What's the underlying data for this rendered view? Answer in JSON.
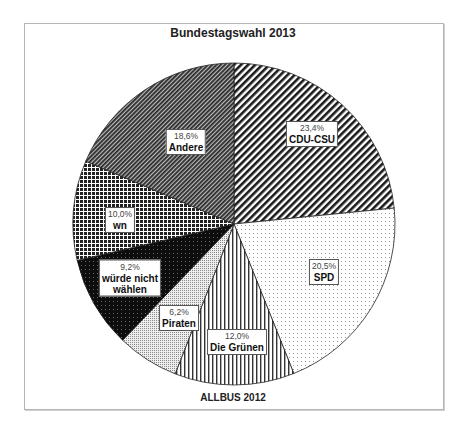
{
  "chart_data": {
    "type": "pie",
    "title": "Bundestagswahl 2013",
    "source_note": "ALLBUS 2012",
    "start_angle_deg": 0,
    "direction": "clockwise",
    "slices": [
      {
        "label": "CDU-CSU",
        "value": 23.4,
        "pct_text": "23,4%",
        "pattern": "diag-wide"
      },
      {
        "label": "SPD",
        "value": 20.5,
        "pct_text": "20,5%",
        "pattern": "dots-light"
      },
      {
        "label": "Die Grünen",
        "value": 12.0,
        "pct_text": "12,0%",
        "pattern": "vertical-lines"
      },
      {
        "label": "Piraten",
        "value": 6.2,
        "pct_text": "6,2%",
        "pattern": "dots-dense"
      },
      {
        "label": "würde nicht wählen",
        "value": 9.2,
        "pct_text": "9,2%",
        "pattern": "black-dots"
      },
      {
        "label": "wn",
        "value": 10.0,
        "pct_text": "10,0%",
        "pattern": "grid"
      },
      {
        "label": "Andere",
        "value": 18.6,
        "pct_text": "18,6%",
        "pattern": "diag-fine"
      }
    ],
    "labels": {
      "cdu": {
        "pct": "23,4%",
        "name": "CDU-CSU"
      },
      "spd": {
        "pct": "20,5%",
        "name": "SPD"
      },
      "gruene": {
        "pct": "12,0%",
        "name": "Die Grünen"
      },
      "piraten": {
        "pct": "6,2%",
        "name": "Piraten"
      },
      "nicht": {
        "pct": "9,2%",
        "name1": "würde nicht",
        "name2": "wählen"
      },
      "wn": {
        "pct": "10,0%",
        "name": "wn"
      },
      "andere": {
        "pct": "18,6%",
        "name": "Andere"
      }
    }
  }
}
